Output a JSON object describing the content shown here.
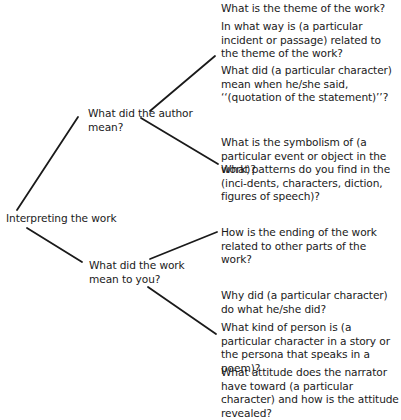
{
  "root": {
    "label": "Interpreting the work"
  },
  "branches": [
    {
      "label_lines": [
        "What did the author",
        "mean?"
      ],
      "questions": [
        "What is the theme of the work?",
        "In what way is (a particular incident or passage) related to the theme of the work?",
        "What did (a particular character) mean when he/she said, ‘‘(quotation of the statement)’’?",
        "What is the symbolism of (a particular event or object in the work)?",
        "What patterns do you find in the (inci-dents, characters, diction, figures of speech)?"
      ]
    },
    {
      "label_lines": [
        "What did the work",
        "mean to you?"
      ],
      "questions": [
        "How is the ending of the work related to other parts of the work?",
        "Why did (a particular character) do what he/she did?",
        "What kind of person is (a particular character in a story or the persona that speaks in a poem)?",
        "What attitude does the narrator have toward (a particular character) and how is the attitude revealed?"
      ]
    }
  ],
  "colors": {
    "ink": "#1a1a1a",
    "background": "#ffffff"
  }
}
